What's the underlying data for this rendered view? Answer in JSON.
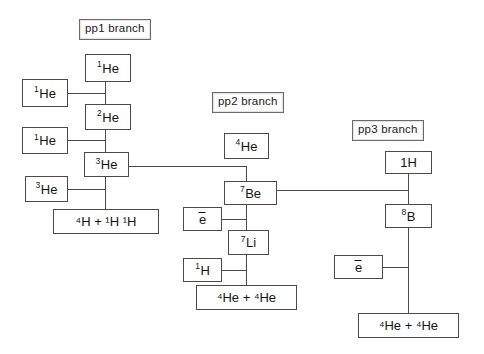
{
  "diagram": {
    "background_color": "#ffffff",
    "line_color": "#4a4a4a",
    "text_color": "#141414"
  },
  "branches": [
    {
      "id": "pp1",
      "label": "pp1 branch"
    },
    {
      "id": "pp2",
      "label": "pp2 branch"
    },
    {
      "id": "pp3",
      "label": "pp3 branch"
    }
  ],
  "nodes": {
    "pp1_he1_top": {
      "mass": "1",
      "symbol": "He"
    },
    "pp1_he1_left1": {
      "mass": "1",
      "symbol": "He"
    },
    "pp1_he2": {
      "mass": "2",
      "symbol": "He"
    },
    "pp1_he1_left2": {
      "mass": "1",
      "symbol": "He"
    },
    "pp1_he3": {
      "mass": "3",
      "symbol": "He"
    },
    "pp1_he3_left": {
      "mass": "3",
      "symbol": "He"
    },
    "pp1_products": {
      "text": "⁴H + ¹H ¹H"
    },
    "pp2_he4": {
      "mass": "4",
      "symbol": "He"
    },
    "pp2_be7": {
      "mass": "7",
      "symbol": "Be"
    },
    "pp2_electron": {
      "text": "e"
    },
    "pp2_li7": {
      "mass": "7",
      "symbol": "Li"
    },
    "pp2_h1": {
      "mass": "1",
      "symbol": "H"
    },
    "pp2_products": {
      "text": "⁴He + ⁴He"
    },
    "pp3_h1": {
      "text": "1H"
    },
    "pp3_b8": {
      "mass": "8",
      "symbol": "B"
    },
    "pp3_electron": {
      "text": "e"
    },
    "pp3_products": {
      "text": "⁴He + ⁴He"
    }
  }
}
